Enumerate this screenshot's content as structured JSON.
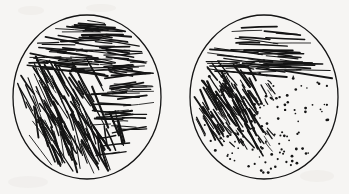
{
  "figure": {
    "kind": "scanned-line-drawing",
    "caption": "",
    "background_color": "#f6f5f3",
    "ink_color": "#141414",
    "width": 349,
    "height": 194,
    "panel_count": 2
  },
  "panels": [
    {
      "id": "left-stimulus-disc",
      "label": "",
      "outline": {
        "cx": 87,
        "cy": 97,
        "rx": 74,
        "ry": 82,
        "stroke_width": 1.3
      },
      "description": "Circular patch divided into three oriented-line texture regions",
      "regions": [
        {
          "name": "upper-horizontal-region",
          "texture": "line-segments",
          "orientation_deg": 4,
          "element_count": 120,
          "mean_length": 34,
          "density": "high"
        },
        {
          "name": "left-diagonal-region",
          "texture": "line-segments",
          "orientation_deg": 62,
          "element_count": 95,
          "mean_length": 40,
          "density": "high"
        },
        {
          "name": "lower-steep-diagonal-region",
          "texture": "line-segments",
          "orientation_deg": 74,
          "element_count": 60,
          "mean_length": 36,
          "density": "medium"
        },
        {
          "name": "right-horizontal-region",
          "texture": "line-segments",
          "orientation_deg": -3,
          "element_count": 70,
          "mean_length": 30,
          "density": "medium"
        }
      ]
    },
    {
      "id": "right-stimulus-disc",
      "label": "",
      "outline": {
        "cx": 264,
        "cy": 97,
        "rx": 74,
        "ry": 82,
        "stroke_width": 1.3
      },
      "description": "Circular patch with horizontal line texture above, diagonal dashes at left, and dot stipple below",
      "regions": [
        {
          "name": "upper-horizontal-region",
          "texture": "line-segments",
          "orientation_deg": 3,
          "element_count": 85,
          "mean_length": 40,
          "density": "high"
        },
        {
          "name": "left-diagonal-region",
          "texture": "line-segments",
          "orientation_deg": 58,
          "element_count": 70,
          "mean_length": 26,
          "density": "medium"
        },
        {
          "name": "transition-dash-region",
          "texture": "short-dashes",
          "orientation_deg": 55,
          "element_count": 45,
          "mean_length": 9,
          "density": "low"
        },
        {
          "name": "lower-dot-region",
          "texture": "dot-stipple",
          "orientation_deg": 0,
          "element_count": 130,
          "mean_length": 2,
          "density": "medium"
        }
      ]
    }
  ]
}
